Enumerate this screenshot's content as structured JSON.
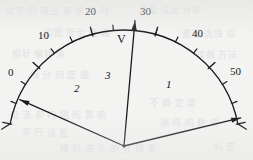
{
  "figure": {
    "kind": "analog-meter-scale-diagram",
    "unit_label": "V",
    "background_color": "#f3f3f2",
    "ink_color": "#15161a",
    "pivot": {
      "x": 124,
      "y": 146
    },
    "arc": {
      "cx": 124,
      "cy": 146,
      "radius": 116,
      "start_angle_deg": -169,
      "end_angle_deg": -11
    }
  },
  "scale": {
    "min": 0,
    "max": 50,
    "major_step": 10,
    "minor_per_major": 2,
    "major_labels": [
      "0",
      "10",
      "20",
      "30",
      "40",
      "50"
    ],
    "major_label_positions": [
      {
        "text": "0",
        "x": 8,
        "y": 67
      },
      {
        "text": "10",
        "x": 38,
        "y": 30
      },
      {
        "text": "20",
        "x": 85,
        "y": 6
      },
      {
        "text": "30",
        "x": 140,
        "y": 6
      },
      {
        "text": "40",
        "x": 192,
        "y": 28
      },
      {
        "text": "50",
        "x": 230,
        "y": 66
      }
    ]
  },
  "unit": {
    "text": "V",
    "x": 117,
    "y": 33
  },
  "needles": [
    {
      "label": "1",
      "value": 41,
      "angle_deg": -13.5,
      "length": 120,
      "label_x": 166,
      "label_y": 79
    },
    {
      "label": "2",
      "value": 10,
      "angle_deg": -156,
      "length": 114,
      "label_x": 74,
      "label_y": 83
    },
    {
      "label": "3",
      "value": 30,
      "angle_deg": -85,
      "length": 126,
      "label_x": 105,
      "label_y": 70
    }
  ],
  "ghost_text": {
    "note": "faint show-through text from reverse of page",
    "lines": [
      {
        "text": "化学 的 电压 表 读 数 时",
        "x": 6,
        "y": 4,
        "size": 9
      },
      {
        "text": "测量 误差 分析",
        "x": 138,
        "y": 3,
        "size": 9
      },
      {
        "text": "如图 所示 电 路",
        "x": 44,
        "y": 26,
        "size": 9
      },
      {
        "text": "量程 选择 与",
        "x": 182,
        "y": 27,
        "size": 9
      },
      {
        "text": "指针 偏转 角",
        "x": 12,
        "y": 47,
        "size": 9
      },
      {
        "text": "读数 方法",
        "x": 196,
        "y": 48,
        "size": 9
      },
      {
        "text": "细 分 刻 度 值",
        "x": 30,
        "y": 68,
        "size": 9
      },
      {
        "text": "不 确 定 度",
        "x": 150,
        "y": 96,
        "size": 9
      },
      {
        "text": "电 流 表 内 阻 的 影 响",
        "x": 10,
        "y": 108,
        "size": 9
      },
      {
        "text": "测 得 的 数 值",
        "x": 160,
        "y": 116,
        "size": 9
      },
      {
        "text": "平 行 误 差",
        "x": 22,
        "y": 126,
        "size": 9
      },
      {
        "text": "模 拟 表 头 的 分 辨 率",
        "x": 60,
        "y": 142,
        "size": 9
      },
      {
        "text": "标 定",
        "x": 214,
        "y": 140,
        "size": 9
      }
    ]
  }
}
